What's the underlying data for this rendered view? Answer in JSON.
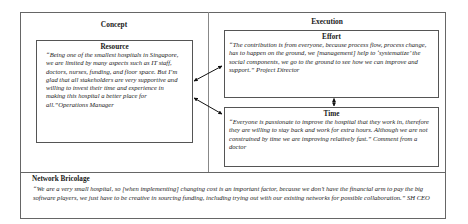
{
  "diagram": {
    "columns": {
      "concept": {
        "title": "Concept"
      },
      "execution": {
        "title": "Execution"
      }
    },
    "boxes": {
      "resource": {
        "title": "Resource",
        "quote": "“Being one of the smallest hospitals in Singapore, we are limited by many aspects such as IT staff, doctors, nurses, funding, and floor space. But I’m glad that all stakeholders are very supportive and willing to invest their time and experience in making this hospital a better place for all.”Operations Manager"
      },
      "effort": {
        "title": "Effort",
        "quote": "“The contribution is from everyone, because process flow, process change, has to happen on the ground, we [management] help to ‘systematize’ the social components, we go to the ground to see how we can improve and support.” Project Director"
      },
      "time": {
        "title": "Time",
        "quote": "“Everyone is passionate to improve the hospital that they work in, therefore they are willing to stay back and work for extra hours. Although we are not constrained by time we are improving relatively fast.” Comment from a doctor"
      }
    },
    "network_bricolage": {
      "title": "Network Bricolage",
      "quote": "“We are a very small hospital, so [when implementing] changing cost is an important factor, because we don’t have the financial arm to pay the big software players, we just have to be creative in sourcing funding, including trying out with our existing networks for possible collaboration.” SH CEO"
    },
    "connectors": [
      {
        "from": "resource",
        "to": "effort",
        "type": "bidirectional-arrow"
      },
      {
        "from": "resource",
        "to": "time",
        "type": "bidirectional-arrow"
      },
      {
        "from": "effort",
        "to": "time",
        "type": "bidirectional-arrow"
      }
    ]
  }
}
